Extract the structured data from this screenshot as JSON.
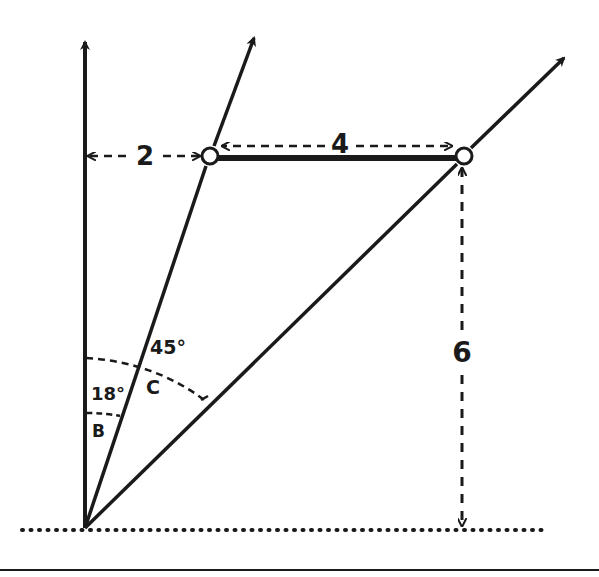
{
  "diagram": {
    "type": "vector-geometry",
    "colors": {
      "ink": "#1a1a1a",
      "background": "#ffffff"
    },
    "labels": {
      "horizontal_offset_left": "2",
      "horizontal_segment": "4",
      "vertical_height": "6",
      "angle_small": "18°",
      "angle_large": "45°",
      "angle_small_name": "B",
      "angle_large_name": "C"
    },
    "points": {
      "origin": [
        85,
        528
      ],
      "left_circle": [
        210,
        156
      ],
      "right_circle": [
        464,
        156
      ]
    }
  }
}
